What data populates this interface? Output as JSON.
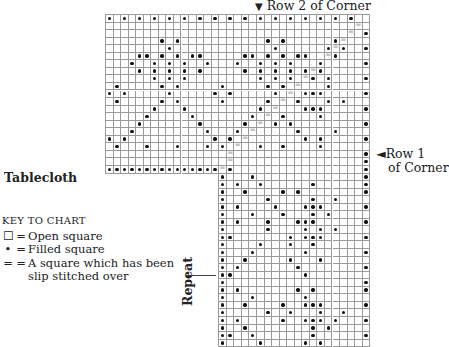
{
  "labels": {
    "row2_arrow": "▼",
    "row2": "Row 2  of Corner",
    "row1_arrow": "◄",
    "row1_line1": "Row 1",
    "row1_line2": "of Corner",
    "title": "Tablecloth",
    "repeat": "Repeat"
  },
  "key": {
    "header": "KEY TO CHART",
    "items": [
      {
        "symbol": "☐",
        "eq": "=",
        "text": "Open square"
      },
      {
        "symbol": "•",
        "eq": "=",
        "text": "Filled square"
      },
      {
        "symbol": "=",
        "eq": "=",
        "text": "A square which has been"
      },
      {
        "symbol": "",
        "eq": "",
        "text": "slip stitched over"
      }
    ]
  },
  "grid": {
    "origin_x": 105,
    "origin_y": 14,
    "cell": 7.55,
    "upper_cols": 35,
    "upper_rows": 21,
    "lower_col_offset": 15,
    "lower_cols": 20,
    "lower_rows": 23,
    "colors": {
      "line": "#9a9a9a",
      "dot": "#111111",
      "slip": "#999999"
    },
    "upper_dots": [
      [
        0,
        0
      ],
      [
        0,
        2
      ],
      [
        0,
        4
      ],
      [
        0,
        6
      ],
      [
        0,
        8
      ],
      [
        0,
        10
      ],
      [
        0,
        12
      ],
      [
        0,
        14
      ],
      [
        0,
        16
      ],
      [
        0,
        18
      ],
      [
        0,
        20
      ],
      [
        0,
        22
      ],
      [
        0,
        24
      ],
      [
        0,
        26
      ],
      [
        0,
        28
      ],
      [
        0,
        30
      ],
      [
        0,
        32
      ],
      [
        2,
        34
      ],
      [
        3,
        7
      ],
      [
        3,
        9
      ],
      [
        3,
        21
      ],
      [
        3,
        23
      ],
      [
        3,
        30
      ],
      [
        4,
        8
      ],
      [
        4,
        22
      ],
      [
        4,
        29
      ],
      [
        4,
        31
      ],
      [
        4,
        34
      ],
      [
        5,
        4
      ],
      [
        5,
        5
      ],
      [
        5,
        7
      ],
      [
        5,
        9
      ],
      [
        5,
        11
      ],
      [
        5,
        12
      ],
      [
        5,
        18
      ],
      [
        5,
        19
      ],
      [
        5,
        21
      ],
      [
        5,
        23
      ],
      [
        5,
        25
      ],
      [
        5,
        26
      ],
      [
        5,
        30
      ],
      [
        6,
        3
      ],
      [
        6,
        6
      ],
      [
        6,
        8
      ],
      [
        6,
        10
      ],
      [
        6,
        13
      ],
      [
        6,
        17
      ],
      [
        6,
        20
      ],
      [
        6,
        22
      ],
      [
        6,
        24
      ],
      [
        6,
        28
      ],
      [
        6,
        34
      ],
      [
        7,
        4
      ],
      [
        7,
        6
      ],
      [
        7,
        8
      ],
      [
        7,
        10
      ],
      [
        7,
        12
      ],
      [
        7,
        18
      ],
      [
        7,
        20
      ],
      [
        7,
        22
      ],
      [
        7,
        24
      ],
      [
        7,
        26
      ],
      [
        7,
        28
      ],
      [
        8,
        6
      ],
      [
        8,
        8
      ],
      [
        8,
        10
      ],
      [
        8,
        20
      ],
      [
        8,
        22
      ],
      [
        8,
        24
      ],
      [
        8,
        27
      ],
      [
        8,
        29
      ],
      [
        8,
        34
      ],
      [
        9,
        1
      ],
      [
        9,
        7
      ],
      [
        9,
        9
      ],
      [
        9,
        15
      ],
      [
        9,
        21
      ],
      [
        9,
        23
      ],
      [
        9,
        29
      ],
      [
        10,
        0
      ],
      [
        10,
        2
      ],
      [
        10,
        8
      ],
      [
        10,
        14
      ],
      [
        10,
        16
      ],
      [
        10,
        22
      ],
      [
        10,
        26
      ],
      [
        10,
        27
      ],
      [
        10,
        28
      ],
      [
        10,
        34
      ],
      [
        11,
        1
      ],
      [
        11,
        7
      ],
      [
        11,
        9
      ],
      [
        11,
        15
      ],
      [
        11,
        21
      ],
      [
        11,
        25
      ],
      [
        11,
        29
      ],
      [
        11,
        31
      ],
      [
        12,
        6
      ],
      [
        12,
        10
      ],
      [
        12,
        20
      ],
      [
        12,
        26
      ],
      [
        12,
        27
      ],
      [
        12,
        28
      ],
      [
        12,
        34
      ],
      [
        13,
        5
      ],
      [
        13,
        11
      ],
      [
        13,
        19
      ],
      [
        13,
        23
      ],
      [
        13,
        28
      ],
      [
        14,
        4
      ],
      [
        14,
        12
      ],
      [
        14,
        18
      ],
      [
        14,
        22
      ],
      [
        14,
        24
      ],
      [
        14,
        34
      ],
      [
        15,
        3
      ],
      [
        15,
        13
      ],
      [
        15,
        17
      ],
      [
        15,
        25
      ],
      [
        15,
        30
      ],
      [
        16,
        0
      ],
      [
        16,
        2
      ],
      [
        16,
        14
      ],
      [
        16,
        16
      ],
      [
        16,
        26
      ],
      [
        16,
        28
      ],
      [
        16,
        34
      ],
      [
        17,
        1
      ],
      [
        17,
        5
      ],
      [
        17,
        9
      ],
      [
        17,
        13
      ],
      [
        17,
        15
      ],
      [
        17,
        20
      ],
      [
        17,
        23
      ],
      [
        17,
        28
      ],
      [
        18,
        34
      ],
      [
        19,
        34
      ],
      [
        20,
        0
      ],
      [
        20,
        1
      ],
      [
        20,
        2
      ],
      [
        20,
        3
      ],
      [
        20,
        4
      ],
      [
        20,
        5
      ],
      [
        20,
        6
      ],
      [
        20,
        7
      ],
      [
        20,
        8
      ],
      [
        20,
        9
      ],
      [
        20,
        10
      ],
      [
        20,
        11
      ],
      [
        20,
        12
      ],
      [
        20,
        13
      ],
      [
        20,
        14
      ],
      [
        20,
        16
      ],
      [
        20,
        34
      ]
    ],
    "upper_slips": [
      [
        1,
        33
      ],
      [
        2,
        32
      ],
      [
        3,
        31
      ],
      [
        4,
        30
      ],
      [
        5,
        29
      ],
      [
        6,
        28
      ],
      [
        7,
        27
      ],
      [
        8,
        26
      ],
      [
        9,
        25
      ],
      [
        10,
        24
      ],
      [
        11,
        23
      ],
      [
        12,
        22
      ],
      [
        13,
        21
      ],
      [
        14,
        20
      ],
      [
        15,
        19
      ],
      [
        16,
        18
      ],
      [
        17,
        17
      ],
      [
        18,
        16
      ],
      [
        19,
        16
      ],
      [
        20,
        15
      ]
    ],
    "lower_dots": [
      [
        0,
        0
      ],
      [
        0,
        4
      ],
      [
        0,
        19
      ],
      [
        1,
        0
      ],
      [
        1,
        2
      ],
      [
        1,
        5
      ],
      [
        1,
        12
      ],
      [
        1,
        19
      ],
      [
        2,
        0
      ],
      [
        2,
        3
      ],
      [
        2,
        8
      ],
      [
        2,
        10
      ],
      [
        2,
        19
      ],
      [
        3,
        0
      ],
      [
        3,
        6
      ],
      [
        3,
        12
      ],
      [
        3,
        15
      ],
      [
        4,
        0
      ],
      [
        4,
        2
      ],
      [
        4,
        7
      ],
      [
        4,
        11
      ],
      [
        4,
        12
      ],
      [
        4,
        13
      ],
      [
        4,
        19
      ],
      [
        5,
        0
      ],
      [
        5,
        4
      ],
      [
        5,
        8
      ],
      [
        5,
        12
      ],
      [
        5,
        14
      ],
      [
        6,
        0
      ],
      [
        6,
        2
      ],
      [
        6,
        6
      ],
      [
        6,
        10
      ],
      [
        6,
        11
      ],
      [
        6,
        12
      ],
      [
        6,
        19
      ],
      [
        7,
        0
      ],
      [
        7,
        6
      ],
      [
        7,
        11
      ],
      [
        7,
        13
      ],
      [
        7,
        15
      ],
      [
        8,
        0
      ],
      [
        8,
        1
      ],
      [
        8,
        9
      ],
      [
        8,
        11
      ],
      [
        8,
        12
      ],
      [
        8,
        13
      ],
      [
        8,
        19
      ],
      [
        9,
        0
      ],
      [
        9,
        5
      ],
      [
        9,
        9
      ],
      [
        9,
        12
      ],
      [
        10,
        0
      ],
      [
        10,
        4
      ],
      [
        10,
        11
      ],
      [
        10,
        19
      ],
      [
        11,
        0
      ],
      [
        11,
        3
      ],
      [
        11,
        9
      ],
      [
        11,
        13
      ],
      [
        12,
        0
      ],
      [
        12,
        2
      ],
      [
        12,
        10
      ],
      [
        12,
        19
      ],
      [
        13,
        0
      ],
      [
        13,
        1
      ],
      [
        13,
        11
      ],
      [
        14,
        0
      ],
      [
        14,
        19
      ],
      [
        15,
        0
      ],
      [
        15,
        2
      ],
      [
        15,
        10
      ],
      [
        15,
        12
      ],
      [
        15,
        19
      ],
      [
        16,
        0
      ],
      [
        16,
        4
      ],
      [
        16,
        11
      ],
      [
        17,
        0
      ],
      [
        17,
        3
      ],
      [
        17,
        8
      ],
      [
        17,
        11
      ],
      [
        17,
        12
      ],
      [
        17,
        13
      ],
      [
        17,
        19
      ],
      [
        18,
        0
      ],
      [
        18,
        6
      ],
      [
        18,
        9
      ],
      [
        18,
        13
      ],
      [
        18,
        16
      ],
      [
        19,
        0
      ],
      [
        19,
        2
      ],
      [
        19,
        8
      ],
      [
        19,
        11
      ],
      [
        19,
        12
      ],
      [
        19,
        13
      ],
      [
        19,
        15
      ],
      [
        19,
        19
      ],
      [
        20,
        0
      ],
      [
        20,
        3
      ],
      [
        20,
        12
      ],
      [
        20,
        14
      ],
      [
        21,
        0
      ],
      [
        21,
        1
      ],
      [
        21,
        4
      ],
      [
        21,
        12
      ],
      [
        21,
        19
      ],
      [
        22,
        0
      ],
      [
        22,
        5
      ],
      [
        22,
        11
      ],
      [
        22,
        13
      ]
    ]
  }
}
